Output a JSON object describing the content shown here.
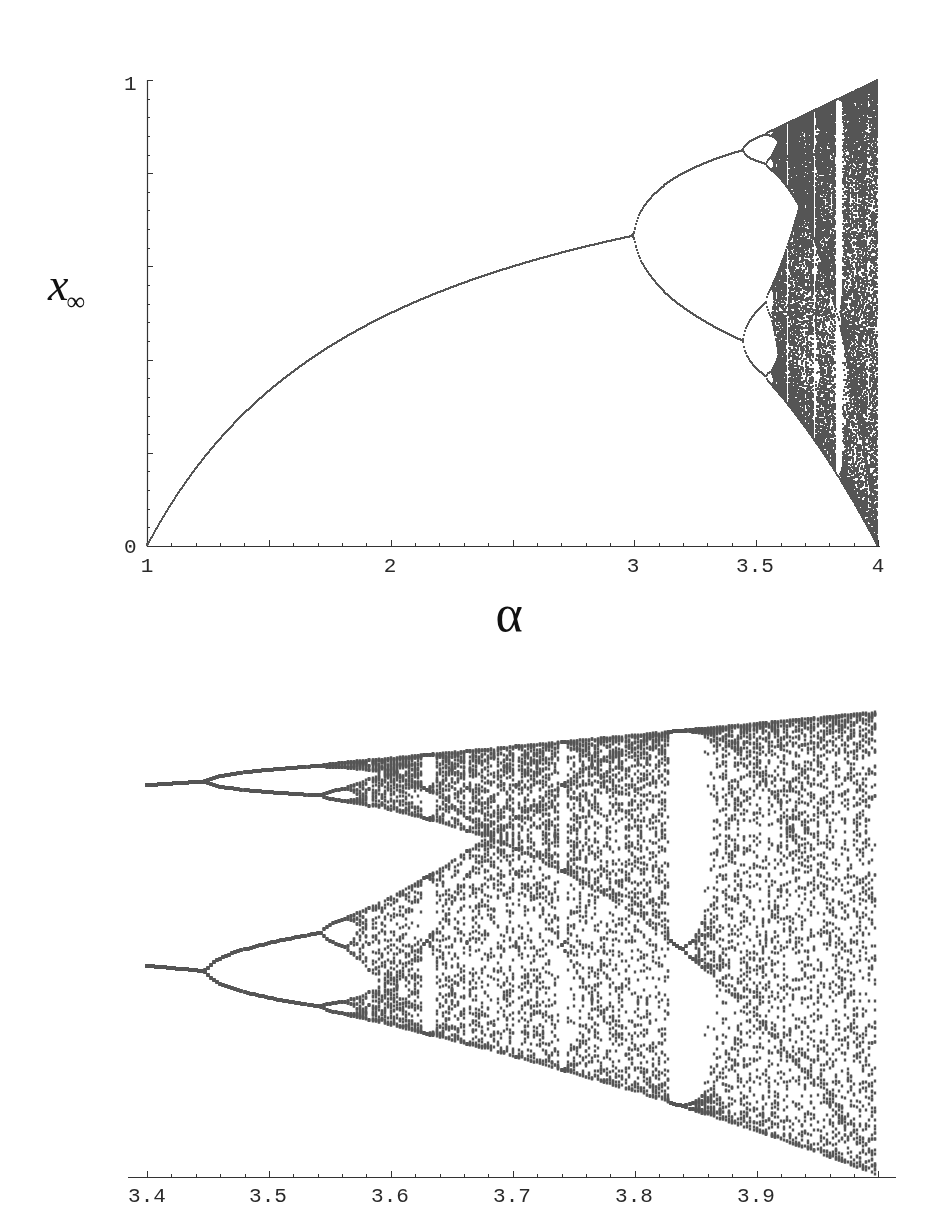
{
  "chart_data": [
    {
      "type": "scatter",
      "name": "logistic-map-bifurcation-full",
      "title": "",
      "xlabel": "α",
      "ylabel": "x∞",
      "ylabel_main": "x",
      "ylabel_sub": "∞",
      "xlim": [
        1,
        4
      ],
      "ylim": [
        0,
        1
      ],
      "x_ticks": [
        {
          "value": 1,
          "label": "1"
        },
        {
          "value": 2,
          "label": "2"
        },
        {
          "value": 3,
          "label": "3"
        },
        {
          "value": 3.5,
          "label": "3.5"
        },
        {
          "value": 4,
          "label": "4"
        }
      ],
      "y_ticks": [
        {
          "value": 0,
          "label": "0"
        },
        {
          "value": 1,
          "label": "1"
        }
      ],
      "x_minor_tick_step": 0.1,
      "y_minor_tick_step": 0.04,
      "y_major_tick_step": 0.2,
      "grid": false,
      "legend": null,
      "map": "x_{n+1} = α x_n (1 - x_n)",
      "key_points": [
        {
          "alpha": 1.0,
          "x": 0.0,
          "note": "fixed point starts at 0"
        },
        {
          "alpha": 2.0,
          "x": 0.5
        },
        {
          "alpha": 3.0,
          "x": 0.667,
          "note": "first period-doubling bifurcation"
        },
        {
          "alpha": 3.449,
          "x": [
            0.44,
            0.85
          ],
          "note": "period-4 bifurcation"
        },
        {
          "alpha": 3.544,
          "note": "period-8 bifurcation"
        },
        {
          "alpha": 3.57,
          "note": "onset of chaos"
        },
        {
          "alpha": 3.83,
          "note": "period-3 window"
        },
        {
          "alpha": 4.0,
          "x": [
            0,
            1
          ],
          "note": "full chaotic band"
        }
      ],
      "sampling": {
        "alpha_step": 0.0041,
        "transient": 300,
        "samples_periodic": 64,
        "samples_chaotic": 260
      },
      "point_color": "#555555"
    },
    {
      "type": "scatter",
      "name": "logistic-map-bifurcation-zoom",
      "title": "",
      "xlabel": "",
      "ylabel": "",
      "xlim": [
        3.4,
        4.0
      ],
      "ylim": [
        0,
        1
      ],
      "x_ticks": [
        {
          "value": 3.4,
          "label": "3.4"
        },
        {
          "value": 3.5,
          "label": "3.5"
        },
        {
          "value": 3.6,
          "label": "3.6"
        },
        {
          "value": 3.7,
          "label": "3.7"
        },
        {
          "value": 3.8,
          "label": "3.8"
        },
        {
          "value": 3.9,
          "label": "3.9"
        }
      ],
      "x_minor_tick_step": 0.02,
      "grid": false,
      "legend": null,
      "key_points": [
        {
          "alpha": 3.4,
          "x": [
            0.452,
            0.842
          ],
          "note": "period-2 branches"
        },
        {
          "alpha": 3.449,
          "note": "period-4 bifurcation"
        },
        {
          "alpha": 3.544,
          "note": "period-8 bifurcation"
        },
        {
          "alpha": 3.63,
          "note": "period-6 window"
        },
        {
          "alpha": 3.74,
          "note": "period-5 window"
        },
        {
          "alpha": 3.83,
          "x": [
            0.16,
            0.51,
            0.96
          ],
          "note": "period-3 window"
        },
        {
          "alpha": 3.96,
          "note": "narrow window"
        },
        {
          "alpha": 4.0,
          "x": [
            0,
            1
          ]
        }
      ],
      "sampling": {
        "alpha_step": 0.0025,
        "transient": 400,
        "samples_periodic": 64,
        "samples_chaotic": 70
      },
      "point_color": "#555555"
    }
  ]
}
